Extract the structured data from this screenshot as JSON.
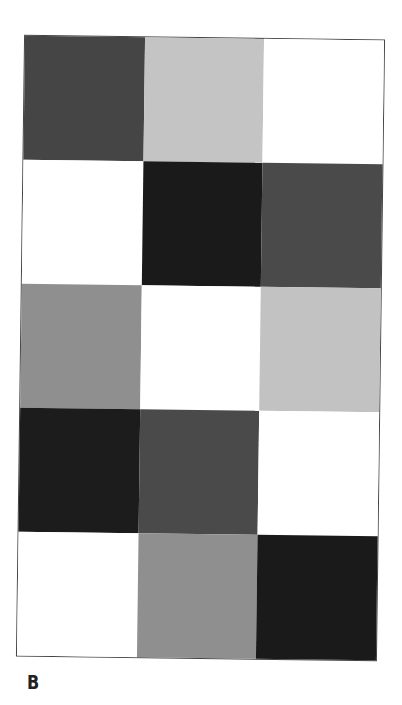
{
  "figure": {
    "label": "B",
    "rows": 5,
    "cols": 3,
    "cells": [
      [
        "#454545",
        "#c4c4c4",
        "#ffffff"
      ],
      [
        "#ffffff",
        "#1a1a1a",
        "#4a4a4a"
      ],
      [
        "#8f8f8f",
        "#ffffff",
        "#c2c2c2"
      ],
      [
        "#1c1c1c",
        "#4a4a4a",
        "#ffffff"
      ],
      [
        "#ffffff",
        "#8f8f8f",
        "#1a1a1a"
      ]
    ],
    "cell_shades": [
      [
        "dark-gray",
        "light-gray",
        "white"
      ],
      [
        "white",
        "black",
        "dark-gray"
      ],
      [
        "mid-gray",
        "white",
        "light-gray"
      ],
      [
        "black",
        "dark-gray",
        "white"
      ],
      [
        "white",
        "mid-gray",
        "black"
      ]
    ]
  }
}
